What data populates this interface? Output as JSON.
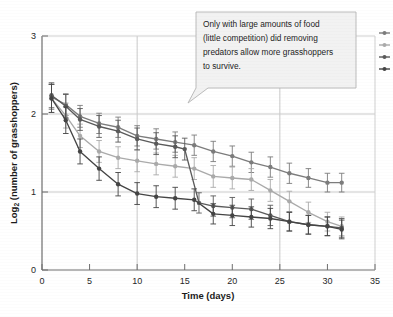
{
  "chart_data": {
    "type": "line",
    "title": "",
    "xlabel": "Time (days)",
    "ylabel": "Log2 (number of grasshoppers)",
    "ylabel_base": "Log",
    "ylabel_sub": "2",
    "ylabel_rest": " (number of grasshoppers)",
    "xlim": [
      0,
      35
    ],
    "ylim": [
      0,
      3
    ],
    "xticks": [
      0,
      5,
      10,
      15,
      20,
      25,
      30,
      35
    ],
    "yticks": [
      0,
      1,
      2,
      3
    ],
    "xtick_labels": [
      "0",
      "5",
      "10",
      "15",
      "20",
      "25",
      "30",
      "35"
    ],
    "ytick_labels": [
      "0",
      "1",
      "2",
      "3"
    ],
    "grid": "major gridlines at x=10, x=25 and y=1, y=2",
    "legend_position": "right-edge-cropped",
    "error_bars": "symmetric vertical, approx 0.12-0.22 log units",
    "series": [
      {
        "name": "high food, predators removed",
        "color": "#7c7c7c",
        "x": [
          1,
          2.5,
          4,
          6,
          8,
          10,
          12,
          14,
          16,
          18,
          20,
          22,
          24,
          26,
          28,
          30,
          31.5
        ],
        "y": [
          2.22,
          2.12,
          1.97,
          1.88,
          1.83,
          1.72,
          1.68,
          1.64,
          1.6,
          1.52,
          1.46,
          1.38,
          1.32,
          1.24,
          1.18,
          1.12,
          1.12
        ],
        "err": [
          0.16,
          0.14,
          0.14,
          0.13,
          0.13,
          0.13,
          0.13,
          0.13,
          0.13,
          0.13,
          0.13,
          0.13,
          0.13,
          0.13,
          0.12,
          0.12,
          0.12
        ]
      },
      {
        "name": "high food, predators present",
        "color": "#aaaaaa",
        "x": [
          1,
          2.5,
          4,
          6,
          8,
          10,
          12,
          14,
          16,
          18,
          20,
          22,
          24,
          26,
          28,
          30,
          31.5
        ],
        "y": [
          2.2,
          1.98,
          1.72,
          1.52,
          1.44,
          1.4,
          1.36,
          1.33,
          1.3,
          1.2,
          1.18,
          1.16,
          1.02,
          0.88,
          0.74,
          0.62,
          0.56
        ],
        "err": [
          0.18,
          0.16,
          0.15,
          0.14,
          0.14,
          0.14,
          0.14,
          0.14,
          0.14,
          0.14,
          0.14,
          0.14,
          0.14,
          0.13,
          0.13,
          0.12,
          0.12
        ]
      },
      {
        "name": "low food, predators removed",
        "color": "#5a5a5a",
        "x": [
          1,
          2.5,
          4,
          6,
          8,
          10,
          12,
          14,
          15,
          16.5,
          18,
          20,
          22,
          24,
          26,
          28,
          30,
          31.5
        ],
        "y": [
          2.24,
          2.1,
          1.93,
          1.84,
          1.78,
          1.68,
          1.62,
          1.58,
          1.55,
          0.86,
          0.82,
          0.8,
          0.78,
          0.7,
          0.62,
          0.58,
          0.56,
          0.54
        ],
        "err": [
          0.16,
          0.15,
          0.14,
          0.14,
          0.14,
          0.14,
          0.14,
          0.14,
          0.14,
          0.13,
          0.13,
          0.13,
          0.13,
          0.13,
          0.12,
          0.12,
          0.12,
          0.12
        ]
      },
      {
        "name": "low food, predators present",
        "color": "#444444",
        "x": [
          1,
          2.5,
          4,
          6,
          8,
          10,
          12,
          14,
          16,
          18,
          20,
          22,
          24,
          26,
          28,
          30,
          31.5
        ],
        "y": [
          2.2,
          1.92,
          1.52,
          1.3,
          1.1,
          0.98,
          0.94,
          0.92,
          0.9,
          0.72,
          0.7,
          0.68,
          0.66,
          0.62,
          0.58,
          0.56,
          0.52
        ],
        "err": [
          0.18,
          0.17,
          0.16,
          0.15,
          0.15,
          0.14,
          0.14,
          0.14,
          0.14,
          0.13,
          0.13,
          0.13,
          0.13,
          0.12,
          0.12,
          0.12,
          0.12
        ]
      }
    ],
    "annotations": [
      {
        "name": "callout",
        "line1": "Only with large amounts of  food",
        "line2": "(little competition) did  removing",
        "line3": "predators allow more grasshoppers",
        "line4": "to survive.",
        "points_to_x": 16,
        "points_to_y": 1.2
      }
    ]
  },
  "colors": {
    "frame": "#6e6e6e",
    "grid": "#c9c9c9",
    "text": "#1a1a1a",
    "callout_fill": "#f2f2f2",
    "callout_border": "#b4b4b4"
  }
}
